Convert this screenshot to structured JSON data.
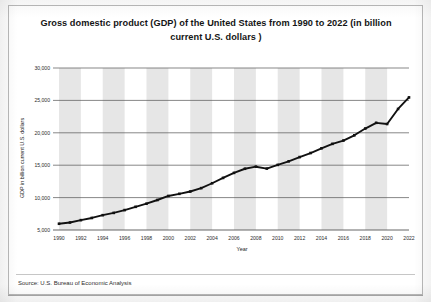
{
  "figure": {
    "title": "Gross domestic product (GDP) of the United States from 1990 to 2022 (in billion current U.S. dollars )",
    "source_note": "Source: U.S. Bureau of Economic Analysis"
  },
  "chart_data": {
    "type": "line",
    "title": "Gross domestic product (GDP) of the United States from 1990 to 2022 (in billion current U.S. dollars )",
    "xlabel": "Year",
    "ylabel": "GDP in billion current U.S. dollars",
    "xlim": [
      1990,
      2022
    ],
    "ylim": [
      5000,
      30000
    ],
    "yticks": [
      5000,
      10000,
      15000,
      20000,
      25000,
      30000
    ],
    "ytick_labels": [
      "5,000",
      "10,000",
      "15,000",
      "20,000",
      "25,000",
      "30,000"
    ],
    "xticks": [
      1990,
      1992,
      1994,
      1996,
      1998,
      2000,
      2002,
      2004,
      2006,
      2008,
      2010,
      2012,
      2014,
      2016,
      2018,
      2020,
      2022
    ],
    "xtick_labels": [
      "1990",
      "1992",
      "1994",
      "1996",
      "1998",
      "2000",
      "2002",
      "2004",
      "2006",
      "2008",
      "2010",
      "2012",
      "2014",
      "2016",
      "2018",
      "2020",
      "2022"
    ],
    "grid": "horizontal",
    "legend": "none",
    "line_color": "#111111",
    "marker": "square",
    "band_color": "#e2e2e2",
    "x": [
      1990,
      1991,
      1992,
      1993,
      1994,
      1995,
      1996,
      1997,
      1998,
      1999,
      2000,
      2001,
      2002,
      2003,
      2004,
      2005,
      2006,
      2007,
      2008,
      2009,
      2010,
      2011,
      2012,
      2013,
      2014,
      2015,
      2016,
      2017,
      2018,
      2019,
      2020,
      2021,
      2022
    ],
    "values": [
      5963,
      6158,
      6520,
      6859,
      7287,
      7640,
      8073,
      8578,
      9063,
      9631,
      10251,
      10582,
      10936,
      11458,
      12214,
      13037,
      13815,
      14452,
      14770,
      14478,
      15049,
      15600,
      16254,
      16880,
      17608,
      18295,
      18805,
      19613,
      20657,
      21540,
      21354,
      23681,
      25463
    ]
  }
}
